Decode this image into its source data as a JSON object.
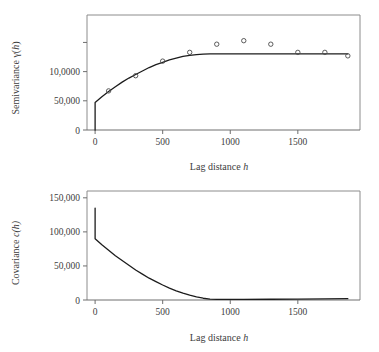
{
  "figure": {
    "panels": [
      {
        "name": "semivariogram",
        "chart_index": 0
      },
      {
        "name": "covariance-function",
        "chart_index": 1
      }
    ]
  },
  "chart_data": [
    {
      "type": "scatter",
      "title": "",
      "xlabel": "Lag distance h",
      "xlabel_plain": "Lag distance",
      "xlabel_italic": "h",
      "ylabel": "Semivariance γ(h)",
      "ylabel_plain": "Semivariance γ(",
      "ylabel_italic": "h",
      "ylabel_tail": ")",
      "xlim": [
        -60,
        1960
      ],
      "ylim": [
        0,
        197000
      ],
      "xticks": [
        0,
        500,
        1000,
        1500
      ],
      "xticklabels": [
        "0",
        "500",
        "1000",
        "1500"
      ],
      "yticks": [
        0,
        50000,
        100000,
        150000
      ],
      "yticklabels": [
        "0",
        "50,000",
        "10,0000",
        ""
      ],
      "grid": false,
      "legend": "none",
      "series": [
        {
          "name": "empirical semivariance",
          "kind": "scatter",
          "marker": "open-circle",
          "x": [
            100,
            300,
            500,
            700,
            900,
            1100,
            1300,
            1500,
            1700,
            1870
          ],
          "y": [
            67000,
            93000,
            118000,
            133000,
            147000,
            153000,
            147000,
            133000,
            133000,
            127000
          ]
        },
        {
          "name": "fitted model",
          "kind": "line",
          "x": [
            0,
            0,
            50,
            100,
            150,
            200,
            250,
            300,
            350,
            400,
            450,
            500,
            550,
            600,
            650,
            700,
            750,
            800,
            850,
            900,
            1000,
            1200,
            1400,
            1600,
            1800,
            1870
          ],
          "y": [
            0,
            47000,
            57000,
            66000,
            74000,
            82000,
            89000,
            95000,
            101000,
            107000,
            112000,
            116000,
            120000,
            123000,
            126000,
            128000,
            129000,
            130000,
            130500,
            130500,
            130500,
            130500,
            130500,
            130500,
            130500,
            130500
          ]
        }
      ]
    },
    {
      "type": "line",
      "title": "",
      "xlabel": "Lag distance h",
      "xlabel_plain": "Lag distance",
      "xlabel_italic": "h",
      "ylabel": "Covariance c(h)",
      "ylabel_plain": "Covariance ",
      "ylabel_italic": "c(h)",
      "ylabel_tail": "",
      "xlim": [
        -60,
        1960
      ],
      "ylim": [
        0,
        160000
      ],
      "xticks": [
        0,
        500,
        1000,
        1500
      ],
      "xticklabels": [
        "0",
        "500",
        "1000",
        "1500"
      ],
      "yticks": [
        0,
        50000,
        100000,
        150000
      ],
      "yticklabels": [
        "0",
        "50,000",
        "100,000",
        "150,000"
      ],
      "grid": false,
      "legend": "none",
      "series": [
        {
          "name": "covariance",
          "kind": "line",
          "marker": "none",
          "x": [
            0,
            0,
            50,
            100,
            150,
            200,
            250,
            300,
            350,
            400,
            450,
            500,
            550,
            600,
            650,
            700,
            750,
            800,
            850,
            900,
            1000,
            1100,
            1300,
            1500,
            1700,
            1870
          ],
          "y": [
            135000,
            90000,
            81000,
            73000,
            65000,
            58000,
            51000,
            44000,
            38000,
            32000,
            27000,
            22000,
            17500,
            13500,
            10000,
            7000,
            4500,
            2600,
            1400,
            800,
            800,
            900,
            1100,
            1400,
            1700,
            2000
          ]
        }
      ]
    }
  ]
}
